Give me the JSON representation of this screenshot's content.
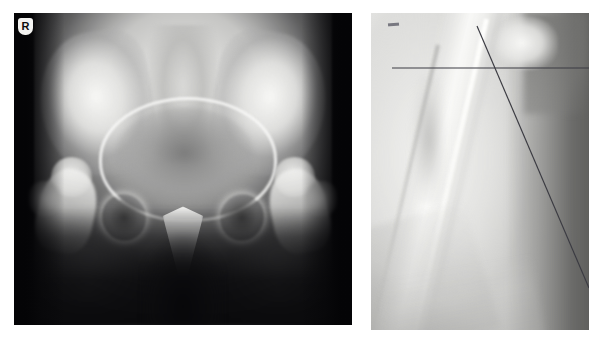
{
  "figure": {
    "background_color": "#ffffff",
    "panel_count": 2
  },
  "panels": [
    {
      "id": "pelvis",
      "label": "AP pelvis radiograph",
      "view": "anteroposterior",
      "region": "pelvis and bilateral hips",
      "modality": "plain radiograph",
      "frame": {
        "x": 14,
        "y": 13,
        "width": 338,
        "height": 312
      },
      "marker": {
        "name": "side-marker",
        "text": "R",
        "meaning": "right side",
        "badge_color": "#f4f4f2",
        "text_color": "#0c0c0c"
      },
      "annotations": []
    },
    {
      "id": "femur",
      "label": "Lateral proximal femur radiograph",
      "view": "lateral / frog-leg",
      "region": "proximal femur and femoral neck",
      "modality": "plain radiograph",
      "frame": {
        "x": 371,
        "y": 13,
        "width": 218,
        "height": 317
      },
      "marker": null,
      "annotations": [
        {
          "name": "horizontal-reference-line",
          "type": "line",
          "orientation": "horizontal",
          "color": "#3b3b42",
          "x1": 21,
          "y1": 55,
          "x2": 218,
          "y2": 55
        },
        {
          "name": "femoral-axis-line",
          "type": "line",
          "orientation": "oblique",
          "color": "#3b3b42",
          "x1": 106,
          "y1": 13,
          "x2": 218,
          "y2": 275
        },
        {
          "name": "pencil-tick-mark",
          "type": "tick",
          "color": "#787880"
        }
      ]
    }
  ],
  "colors": {
    "page_background": "#ffffff",
    "pelvis_film_black": "#08080a",
    "pelvis_bone_white": "#f8f8f6",
    "femur_film_gray": "#d8d8d6",
    "annotation_line": "#3b3b42",
    "marker_badge": "#f4f4f2"
  }
}
